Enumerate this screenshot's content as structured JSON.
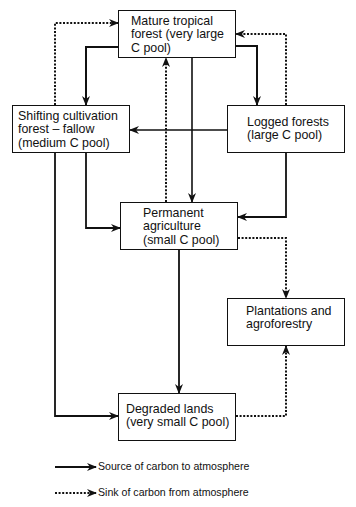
{
  "nodes": {
    "mature": {
      "lines": [
        "Mature tropical",
        "forest (very large",
        "C pool)"
      ]
    },
    "shifting": {
      "lines": [
        "Shifting cultivation",
        "forest – fallow",
        "(medium C pool)"
      ]
    },
    "logged": {
      "lines": [
        "Logged forests",
        "(large C pool)"
      ]
    },
    "permanent": {
      "lines": [
        "Permanent",
        "agriculture",
        "(small C pool)"
      ]
    },
    "plantations": {
      "lines": [
        "Plantations and",
        "agroforestry"
      ]
    },
    "degraded": {
      "lines": [
        "Degraded lands",
        "(very small C pool)"
      ]
    }
  },
  "edges": [
    {
      "from": "mature",
      "to": "shifting",
      "type": "source"
    },
    {
      "from": "mature",
      "to": "logged",
      "type": "source"
    },
    {
      "from": "mature",
      "to": "permanent",
      "type": "source"
    },
    {
      "from": "shifting",
      "to": "mature",
      "type": "sink"
    },
    {
      "from": "logged",
      "to": "mature",
      "type": "sink"
    },
    {
      "from": "permanent",
      "to": "mature",
      "type": "sink"
    },
    {
      "from": "logged",
      "to": "shifting",
      "type": "source"
    },
    {
      "from": "shifting",
      "to": "permanent",
      "type": "source"
    },
    {
      "from": "logged",
      "to": "permanent",
      "type": "source"
    },
    {
      "from": "shifting",
      "to": "degraded",
      "type": "source"
    },
    {
      "from": "permanent",
      "to": "degraded",
      "type": "source"
    },
    {
      "from": "permanent",
      "to": "plantations",
      "type": "sink"
    },
    {
      "from": "degraded",
      "to": "plantations",
      "type": "sink"
    }
  ],
  "legend": {
    "source": "Source of carbon to atmosphere",
    "sink": "Sink of carbon from atmosphere"
  }
}
